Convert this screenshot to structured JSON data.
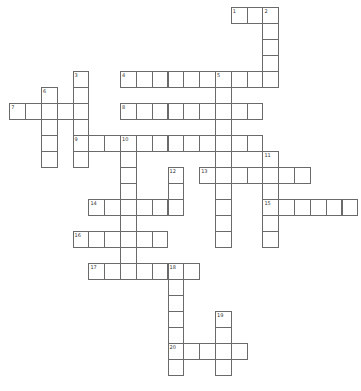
{
  "puzzle": {
    "type": "crossword",
    "words": [
      {
        "number": "1",
        "direction": "across",
        "row": 0,
        "col": 14,
        "length": 3
      },
      {
        "number": "2",
        "direction": "down",
        "row": 0,
        "col": 16,
        "length": 5
      },
      {
        "number": "3",
        "direction": "down",
        "row": 4,
        "col": 4,
        "length": 6
      },
      {
        "number": "4",
        "direction": "across",
        "row": 4,
        "col": 7,
        "length": 10
      },
      {
        "number": "5",
        "direction": "down",
        "row": 4,
        "col": 13,
        "length": 11
      },
      {
        "number": "6",
        "direction": "down",
        "row": 5,
        "col": 2,
        "length": 5
      },
      {
        "number": "7",
        "direction": "across",
        "row": 6,
        "col": 0,
        "length": 5
      },
      {
        "number": "8",
        "direction": "across",
        "row": 6,
        "col": 7,
        "length": 9
      },
      {
        "number": "9",
        "direction": "across",
        "row": 8,
        "col": 4,
        "length": 12
      },
      {
        "number": "10",
        "direction": "down",
        "row": 8,
        "col": 7,
        "length": 9
      },
      {
        "number": "11",
        "direction": "down",
        "row": 9,
        "col": 16,
        "length": 6
      },
      {
        "number": "12",
        "direction": "down",
        "row": 10,
        "col": 10,
        "length": 3
      },
      {
        "number": "13",
        "direction": "across",
        "row": 10,
        "col": 12,
        "length": 7
      },
      {
        "number": "14",
        "direction": "across",
        "row": 12,
        "col": 5,
        "length": 6
      },
      {
        "number": "15",
        "direction": "across",
        "row": 12,
        "col": 16,
        "length": 6
      },
      {
        "number": "16",
        "direction": "across",
        "row": 14,
        "col": 4,
        "length": 6
      },
      {
        "number": "17",
        "direction": "across",
        "row": 16,
        "col": 5,
        "length": 7
      },
      {
        "number": "18",
        "direction": "down",
        "row": 16,
        "col": 10,
        "length": 7
      },
      {
        "number": "19",
        "direction": "down",
        "row": 19,
        "col": 13,
        "length": 4
      },
      {
        "number": "20",
        "direction": "across",
        "row": 21,
        "col": 10,
        "length": 5
      }
    ]
  }
}
